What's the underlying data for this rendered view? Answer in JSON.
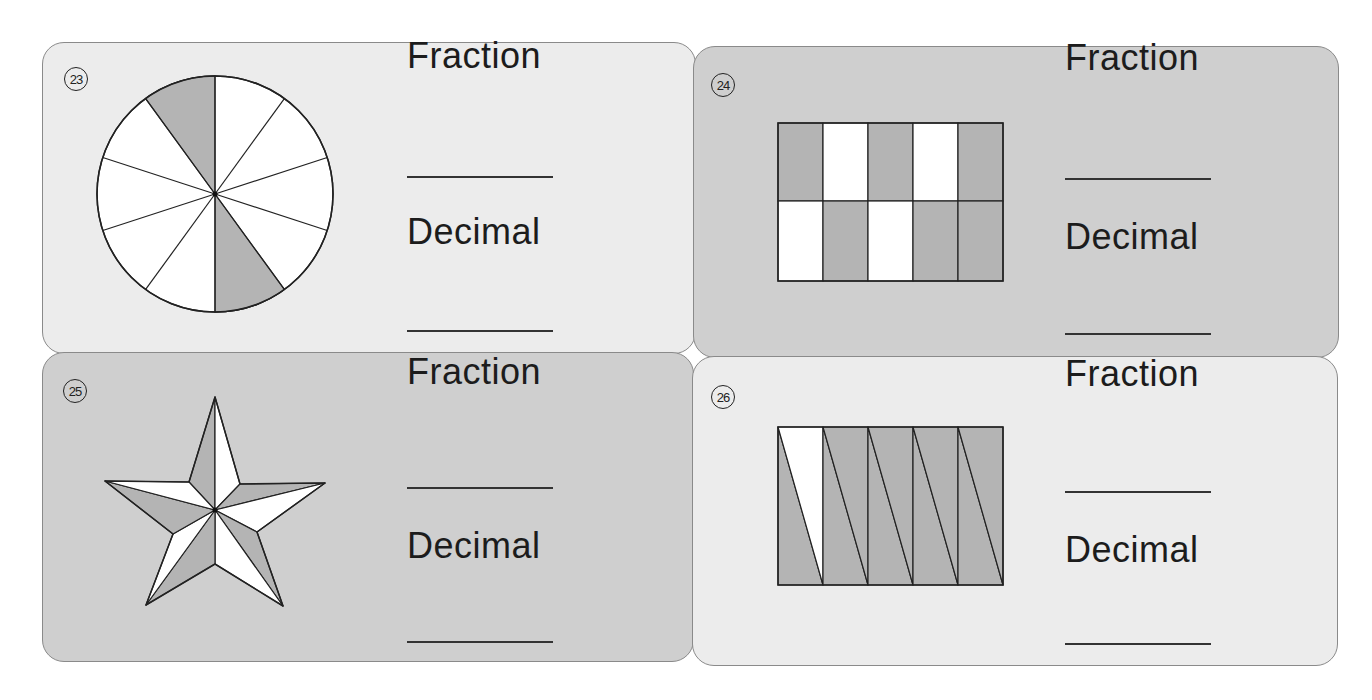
{
  "worksheet": {
    "fill_colors": {
      "shaded": "#b4b4b4",
      "unshaded": "#ffffff",
      "outline": "#222222"
    },
    "problems": [
      {
        "number": "23",
        "figure": "circle divided into 10 equal sectors",
        "total_parts": 10,
        "shaded_parts": 2,
        "fraction_label": "Fraction",
        "decimal_label": "Decimal",
        "fraction_answer": "",
        "decimal_answer": ""
      },
      {
        "number": "24",
        "figure": "rectangle divided into 2 rows x 5 columns",
        "total_parts": 10,
        "shaded_parts": 6,
        "fraction_label": "Fraction",
        "decimal_label": "Decimal",
        "fraction_answer": "",
        "decimal_answer": ""
      },
      {
        "number": "25",
        "figure": "five-pointed star divided into 10 triangles",
        "total_parts": 10,
        "shaded_parts": 5,
        "fraction_label": "Fraction",
        "decimal_label": "Decimal",
        "fraction_answer": "",
        "decimal_answer": ""
      },
      {
        "number": "26",
        "figure": "rectangle divided into 10 triangles (5 columns split diagonally)",
        "total_parts": 10,
        "shaded_parts": 9,
        "fraction_label": "Fraction",
        "decimal_label": "Decimal",
        "fraction_answer": "",
        "decimal_answer": ""
      }
    ]
  }
}
